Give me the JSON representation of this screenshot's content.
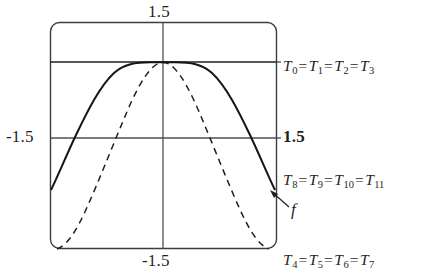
{
  "figure": {
    "type": "taylor-polynomial-approximation-plot",
    "axis_ticks": {
      "top": "1.5",
      "bottom": "-1.5",
      "left": "-1.5",
      "right": "1.5"
    },
    "series_labels": [
      {
        "id": "t0",
        "text": "T0 = T1 = T2 = T3",
        "terms": [
          "T0",
          "T1",
          "T2",
          "T3"
        ]
      },
      {
        "id": "t8",
        "text": "T8 = T9 = T10 = T11",
        "terms": [
          "T8",
          "T9",
          "T10",
          "T11"
        ]
      },
      {
        "id": "t4",
        "text": "T4 = T5 = T6 = T7",
        "terms": [
          "T4",
          "T5",
          "T6",
          "T7"
        ]
      }
    ],
    "function_label": "f",
    "colors": {
      "curve": "#1a1a1a",
      "axis": "#4a4a4a",
      "frame": "#3d3d3d",
      "text": "#1f1f1f"
    }
  },
  "chart_data": {
    "type": "line",
    "title": "",
    "xlabel": "",
    "ylabel": "",
    "xlim": [
      -1.5,
      1.5
    ],
    "ylim": [
      -1.5,
      1.5
    ],
    "grid": false,
    "legend_position": "right",
    "axis_tick_labels": {
      "x": [
        "-1.5",
        "1.5"
      ],
      "y": [
        "-1.5",
        "1.5"
      ]
    },
    "annotations": [
      {
        "text": "T0 = T1 = T2 = T3",
        "x": 1.55,
        "y": 1.0,
        "anchor": "left"
      },
      {
        "text": "T8 = T9 = T10 = T11",
        "x": 1.55,
        "y": -0.5,
        "anchor": "left"
      },
      {
        "text": "T4 = T5 = T6 = T7",
        "x": 1.55,
        "y": -1.55,
        "anchor": "left"
      },
      {
        "text": "f",
        "x": 1.65,
        "y": -0.95,
        "anchor": "left",
        "arrow_to": [
          1.42,
          -0.7
        ]
      }
    ],
    "series": [
      {
        "name": "T0 = T1 = T2 = T3",
        "style": "solid",
        "description": "horizontal line at y = 1 spanning full x range",
        "x": [
          -1.5,
          1.5
        ],
        "y": [
          1.0,
          1.0
        ]
      },
      {
        "name": "T8 = T9 = T10 = T11",
        "style": "solid",
        "description": "flat-topped even polynomial approximation, plateau near y = 1 then falling steeply near the edges",
        "x": [
          -1.5,
          -1.4,
          -1.3,
          -1.2,
          -1.1,
          -1.0,
          -0.9,
          -0.8,
          -0.7,
          -0.6,
          -0.5,
          -0.4,
          -0.3,
          -0.2,
          -0.1,
          0.0,
          0.1,
          0.2,
          0.3,
          0.4,
          0.5,
          0.6,
          0.7,
          0.8,
          0.9,
          1.0,
          1.1,
          1.2,
          1.3,
          1.4,
          1.5
        ],
        "y": [
          -0.44,
          -0.12,
          0.16,
          0.41,
          0.61,
          0.76,
          0.86,
          0.93,
          0.97,
          0.99,
          1.0,
          1.0,
          1.0,
          1.0,
          1.0,
          1.0,
          1.0,
          1.0,
          1.0,
          1.0,
          1.0,
          0.99,
          0.97,
          0.93,
          0.86,
          0.76,
          0.61,
          0.41,
          0.16,
          -0.12,
          -0.44
        ]
      },
      {
        "name": "f",
        "style": "dashed",
        "description": "target function: matches the polynomial near the centre then drops faster to the bottom of the frame at the edges",
        "x": [
          -1.5,
          -1.4,
          -1.3,
          -1.2,
          -1.1,
          -1.0,
          -0.9,
          -0.8,
          -0.7,
          -0.6,
          -0.5,
          -0.4,
          -0.3,
          -0.2,
          -0.1,
          0.0,
          0.1,
          0.2,
          0.3,
          0.4,
          0.5,
          0.6,
          0.7,
          0.8,
          0.9,
          1.0,
          1.1,
          1.2,
          1.3,
          1.4,
          1.5
        ],
        "y": [
          -1.5,
          -1.18,
          -0.84,
          -0.5,
          -0.18,
          0.11,
          0.37,
          0.58,
          0.75,
          0.87,
          0.95,
          0.99,
          1.0,
          1.0,
          1.0,
          1.0,
          1.0,
          1.0,
          1.0,
          0.99,
          0.95,
          0.87,
          0.75,
          0.58,
          0.37,
          0.11,
          -0.18,
          -0.5,
          -0.84,
          -1.18,
          -1.5
        ]
      }
    ]
  }
}
